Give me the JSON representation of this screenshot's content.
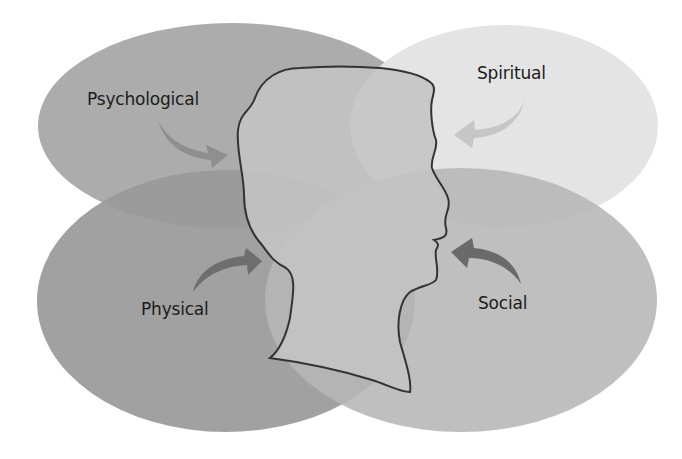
{
  "diagram": {
    "type": "overlapping-ellipses-with-head-silhouette",
    "central_figure": "human-head-profile",
    "dimensions": [
      {
        "id": "psychological",
        "label": "Psychological",
        "position": "top-left",
        "fill": "#acacac",
        "arrow_color": "#8f8f8f"
      },
      {
        "id": "spiritual",
        "label": "Spiritual",
        "position": "top-right",
        "fill": "#e4e4e4",
        "arrow_color": "#c6c6c6"
      },
      {
        "id": "physical",
        "label": "Physical",
        "position": "bottom-left",
        "fill": "#9a9a9a",
        "arrow_color": "#6e6e6e"
      },
      {
        "id": "social",
        "label": "Social",
        "position": "bottom-right",
        "fill": "#b8b8b8",
        "arrow_color": "#6a6a6a"
      }
    ],
    "head": {
      "fill": "#c4c4c4",
      "outline": "#333333"
    }
  }
}
